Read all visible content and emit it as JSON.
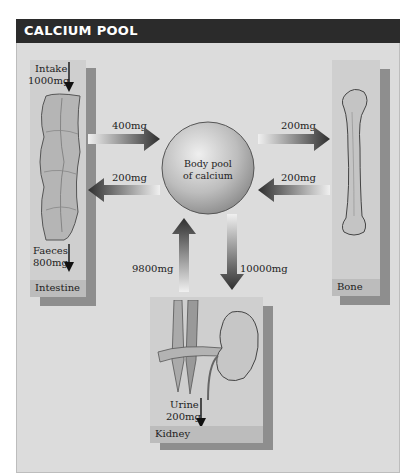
{
  "header": {
    "title": "CALCIUM POOL"
  },
  "center": {
    "label_line1": "Body pool",
    "label_line2": "of calcium"
  },
  "intestine": {
    "panel_label": "Intestine",
    "intake_label": "Intake",
    "intake_value": "1000mg",
    "faeces_label": "Faeces",
    "faeces_value": "800mg"
  },
  "bone": {
    "panel_label": "Bone"
  },
  "kidney": {
    "panel_label": "Kidney",
    "urine_label": "Urine",
    "urine_value": "200mg"
  },
  "flows": {
    "intestine_to_pool": "400mg",
    "pool_to_intestine": "200mg",
    "pool_to_bone": "200mg",
    "bone_to_pool": "200mg",
    "kidney_to_pool": "9800mg",
    "pool_to_kidney": "10000mg"
  },
  "colors": {
    "title_bar": "#2b2b2b",
    "background": "#dcdcdc",
    "panel": "#cfcfcf",
    "panel_shadow": "#8e8e8e",
    "arrow_dark": "#3a3a3a"
  }
}
